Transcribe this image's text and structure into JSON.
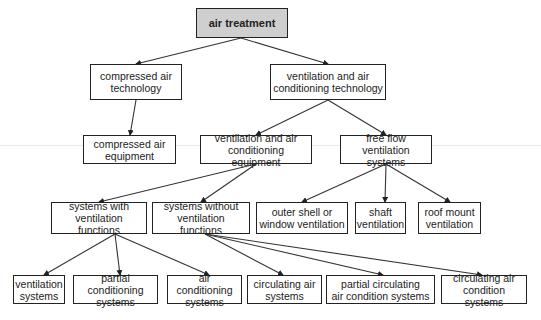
{
  "diagram": {
    "type": "tree",
    "colors": {
      "root_fill": "#cfcfcf",
      "node_fill": "#ffffff",
      "border": "#222222",
      "edge": "#333333"
    },
    "nodes": [
      {
        "id": "air_treatment",
        "label": "air treatment",
        "x": 196,
        "y": 8,
        "w": 92,
        "h": 30,
        "root": true
      },
      {
        "id": "compressed_air_technology",
        "label": "compressed air\ntechnology",
        "x": 90,
        "y": 64,
        "w": 92,
        "h": 36
      },
      {
        "id": "vac_technology",
        "label": "ventilation and air\nconditioning technology",
        "x": 270,
        "y": 64,
        "w": 116,
        "h": 36
      },
      {
        "id": "compressed_air_equipment",
        "label": "compressed air\nequipment",
        "x": 83,
        "y": 135,
        "w": 93,
        "h": 29
      },
      {
        "id": "vac_equipment",
        "label": "ventilation and air\nconditioning equipment",
        "x": 200,
        "y": 135,
        "w": 112,
        "h": 29
      },
      {
        "id": "free_flow",
        "label": "free flow\nventilation systems",
        "x": 340,
        "y": 135,
        "w": 92,
        "h": 29
      },
      {
        "id": "with_vent",
        "label": "systems with\nventilation functions",
        "x": 51,
        "y": 202,
        "w": 96,
        "h": 32
      },
      {
        "id": "without_vent",
        "label": "systems without\nventilation functions",
        "x": 152,
        "y": 202,
        "w": 98,
        "h": 32
      },
      {
        "id": "outer_shell",
        "label": "outer shell or\nwindow ventilation",
        "x": 256,
        "y": 202,
        "w": 92,
        "h": 32
      },
      {
        "id": "shaft",
        "label": "shaft\nventilation",
        "x": 355,
        "y": 202,
        "w": 51,
        "h": 32
      },
      {
        "id": "roof_mount",
        "label": "roof mount\nventilation",
        "x": 418,
        "y": 202,
        "w": 63,
        "h": 32
      },
      {
        "id": "ventilation_systems",
        "label": "ventilation\nsystems",
        "x": 13,
        "y": 275,
        "w": 52,
        "h": 29
      },
      {
        "id": "partial_conditioning",
        "label": "partial conditioning\nsystems",
        "x": 73,
        "y": 275,
        "w": 85,
        "h": 29
      },
      {
        "id": "air_conditioning",
        "label": "air conditioning\nsystems",
        "x": 167,
        "y": 275,
        "w": 75,
        "h": 29
      },
      {
        "id": "circulating_air",
        "label": "circulating air\nsystems",
        "x": 247,
        "y": 275,
        "w": 75,
        "h": 29
      },
      {
        "id": "partial_circulating",
        "label": "partial circulating\nair condition systems",
        "x": 326,
        "y": 275,
        "w": 109,
        "h": 29
      },
      {
        "id": "circulating_air_condition",
        "label": "circulating air\ncondition systems",
        "x": 441,
        "y": 275,
        "w": 86,
        "h": 29
      }
    ],
    "edges": [
      {
        "from": [
          241,
          38
        ],
        "to": [
          136,
          64
        ]
      },
      {
        "from": [
          241,
          38
        ],
        "to": [
          328,
          64
        ]
      },
      {
        "from": [
          136,
          100
        ],
        "to": [
          130,
          135
        ]
      },
      {
        "from": [
          328,
          100
        ],
        "to": [
          256,
          135
        ]
      },
      {
        "from": [
          328,
          100
        ],
        "to": [
          386,
          135
        ]
      },
      {
        "from": [
          256,
          164
        ],
        "to": [
          99,
          202
        ]
      },
      {
        "from": [
          256,
          164
        ],
        "to": [
          201,
          202
        ]
      },
      {
        "from": [
          386,
          164
        ],
        "to": [
          302,
          202
        ]
      },
      {
        "from": [
          386,
          164
        ],
        "to": [
          385,
          202
        ]
      },
      {
        "from": [
          386,
          164
        ],
        "to": [
          450,
          202
        ]
      },
      {
        "from": [
          115,
          234
        ],
        "to": [
          44,
          275
        ]
      },
      {
        "from": [
          115,
          234
        ],
        "to": [
          120,
          275
        ]
      },
      {
        "from": [
          115,
          234
        ],
        "to": [
          209,
          275
        ]
      },
      {
        "from": [
          205,
          234
        ],
        "to": [
          283,
          275
        ]
      },
      {
        "from": [
          205,
          234
        ],
        "to": [
          383,
          275
        ]
      },
      {
        "from": [
          205,
          234
        ],
        "to": [
          482,
          275
        ]
      }
    ]
  }
}
